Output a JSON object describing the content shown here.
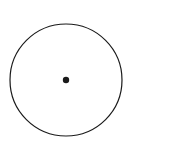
{
  "figure": {
    "background_color": "#ffffff",
    "stroke_color": "#1a1a1a",
    "highlight_color": "#8c8c8c",
    "circle": {
      "center_x": 66,
      "center_y": 80,
      "radius": 56,
      "total_sectors": 9,
      "sector_angle_degrees": 40
    },
    "sector_labels": [
      {
        "id": "sector-label-upper",
        "text": "1/9",
        "numerator": "1",
        "denominator": "9",
        "x": 103,
        "y": 54
      },
      {
        "id": "sector-label-middle",
        "text": "1/9",
        "numerator": "1",
        "denominator": "9",
        "x": 110,
        "y": 81
      },
      {
        "id": "sector-label-lower",
        "text": "1/9",
        "numerator": "1",
        "denominator": "9",
        "x": 103,
        "y": 109
      }
    ],
    "brace": {
      "label": "1/3",
      "numerator": "1",
      "denominator": "3",
      "label_x": 162,
      "label_y": 81,
      "top_y": 29,
      "bottom_y": 131,
      "x": 146
    },
    "radii": [
      {
        "id": "radius-0",
        "angle_degrees": 0,
        "style": "solid",
        "color": "#8c8c8c",
        "width": 1.6
      },
      {
        "id": "radius-40",
        "angle_degrees": 40,
        "style": "dashed",
        "color": "#1a1a1a",
        "width": 1
      },
      {
        "id": "radius-80",
        "angle_degrees": 80,
        "style": "dashed",
        "color": "#1a1a1a",
        "width": 1
      },
      {
        "id": "radius-120",
        "angle_degrees": 120,
        "style": "dashed",
        "color": "#1a1a1a",
        "width": 1
      },
      {
        "id": "radius-160",
        "angle_degrees": 160,
        "style": "dashed",
        "color": "#1a1a1a",
        "width": 1
      },
      {
        "id": "radius-200",
        "angle_degrees": 200,
        "style": "solid",
        "color": "#1a1a1a",
        "width": 1
      },
      {
        "id": "radius-240",
        "angle_degrees": 240,
        "style": "dashed",
        "color": "#1a1a1a",
        "width": 1
      },
      {
        "id": "radius-280",
        "angle_degrees": 280,
        "style": "dashed",
        "color": "#1a1a1a",
        "width": 1
      },
      {
        "id": "radius-320",
        "angle_degrees": 320,
        "style": "solid",
        "color": "#1a1a1a",
        "width": 1
      }
    ],
    "highlight_arc": {
      "start_angle_degrees": 150,
      "end_angle_degrees": 95,
      "color": "#8c8c8c"
    },
    "center_marker": {
      "x": 66,
      "y": 80,
      "radius": 3.2,
      "color": "#1a1a1a"
    }
  }
}
